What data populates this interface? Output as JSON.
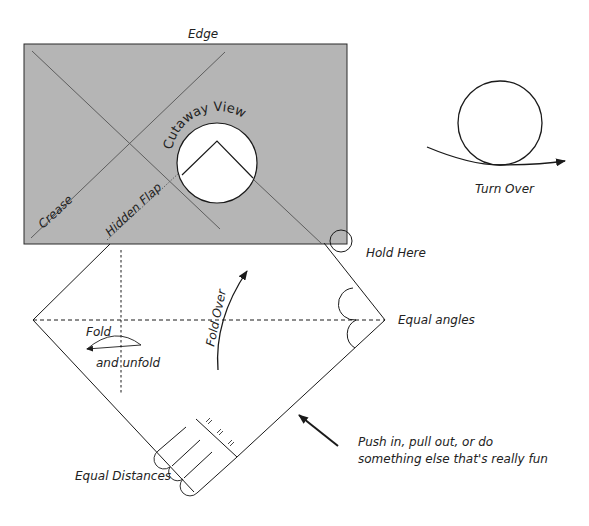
{
  "diagram": {
    "colors": {
      "paper_gray": "#b5b5b5",
      "line": "#1a1a1a",
      "crease": "#5a5a5a",
      "background": "#ffffff"
    },
    "labels": {
      "edge": "Edge",
      "crease": "Crease",
      "hidden_flap": "Hidden Flap",
      "cutaway_view": "Cutaway View",
      "turn_over": "Turn Over",
      "hold_here": "Hold Here",
      "equal_angles": "Equal angles",
      "fold": "Fold",
      "and_unfold": "and unfold",
      "fold_over": "Fold Over",
      "push_line1": "Push in, pull out, or do",
      "push_line2": "something else that's really fun",
      "equal_distances": "Equal Distances"
    }
  }
}
